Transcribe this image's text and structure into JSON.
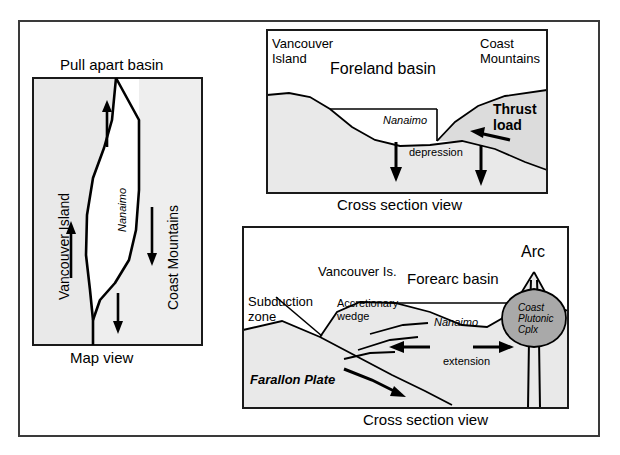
{
  "figure": {
    "background": "#ffffff",
    "frame_color": "#3a3a3a",
    "shade_light": "#e9e9e9",
    "shade_mid": "#dcdcdc",
    "shade_dark": "#a9a9a9",
    "line_color": "#000000"
  },
  "panel_map": {
    "title": "Pull apart basin",
    "caption": "Map view",
    "left_block_label": "Vancouver Island",
    "right_block_label": "Coast Mountains",
    "basin_label": "Nanaimo",
    "arrows": [
      {
        "name": "left-block-up-arrow",
        "direction": "up"
      },
      {
        "name": "inner-up-arrow",
        "direction": "up"
      },
      {
        "name": "right-block-down-arrow",
        "direction": "down"
      },
      {
        "name": "lower-down-arrow",
        "direction": "down"
      }
    ]
  },
  "panel_foreland": {
    "caption": "Cross section view",
    "label_vancouver_island": "Vancouver Island",
    "label_basin": "Foreland basin",
    "label_coast_mountains": "Coast Mountains",
    "label_thrust_load": "Thrust load",
    "label_nanaimo": "Nanaimo",
    "label_depression": "depression",
    "arrows": [
      {
        "name": "subsidence-arrow-left",
        "direction": "down"
      },
      {
        "name": "subsidence-arrow-right",
        "direction": "down"
      },
      {
        "name": "thrust-vergence-arrow",
        "direction": "left"
      }
    ]
  },
  "panel_forearc": {
    "caption": "Cross section view",
    "label_subduction_zone": "Subduction zone",
    "label_accretionary_wedge": "Accretionary wedge",
    "label_vancouver_island": "Vancouver Is.",
    "label_basin": "Forearc basin",
    "label_arc": "Arc",
    "label_nanaimo": "Nanaimo",
    "label_extension": "extension",
    "label_farallon_plate": "Farallon Plate",
    "label_pluton": "Coast Plutonic Cplx",
    "arrows": [
      {
        "name": "subduction-slip-arrow",
        "direction": "right-down"
      },
      {
        "name": "extension-arrow-left",
        "direction": "left"
      },
      {
        "name": "extension-arrow-right",
        "direction": "right"
      }
    ]
  }
}
